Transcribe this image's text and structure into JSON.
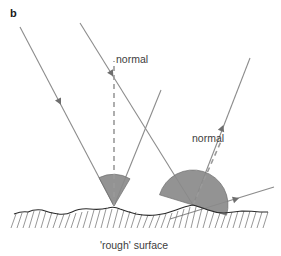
{
  "figure": {
    "panel_letter": "b",
    "caption": "'rough' surface",
    "labels": {
      "normal_left": "normal",
      "normal_right": "normal"
    },
    "colors": {
      "ray_line": "#8c8c8c",
      "arrowhead": "#6e6e6e",
      "normal_dash": "#9a9a9a",
      "wedge_fill": "#8a8a8a",
      "wedge_stroke": "#6f6f6f",
      "surface_line": "#2b2b2b",
      "hatch_line": "#6a6a6a",
      "text": "#3d3d3d",
      "panel_letter": "#1a1a1a",
      "background": "#ffffff"
    },
    "geometry": {
      "incident_rays": [
        {
          "name": "incident-ray-left",
          "x1": 20,
          "y1": 27,
          "x2": 114,
          "y2": 206
        },
        {
          "name": "incident-ray-right",
          "x1": 80,
          "y1": 23,
          "x2": 193,
          "y2": 205
        }
      ],
      "reflected_rays": [
        {
          "name": "reflected-ray-left",
          "x1": 114,
          "y1": 206,
          "x2": 160,
          "y2": 92
        },
        {
          "name": "reflected-ray-right",
          "x1": 193,
          "y1": 205,
          "x2": 249,
          "y2": 60
        }
      ],
      "normals": [
        {
          "name": "normal-left",
          "x1": 114,
          "y1": 206,
          "x2": 114,
          "y2": 60,
          "style": "dashed",
          "orientation": "vertical"
        },
        {
          "name": "normal-right",
          "x1": 193,
          "y1": 205,
          "x2": 222,
          "y2": 140,
          "style": "dashed",
          "orientation": "tilted"
        }
      ],
      "tangent": {
        "name": "surface-tangent-right",
        "x1": 168,
        "y1": 219,
        "x2": 273,
        "y2": 187
      },
      "wedges": [
        {
          "name": "angle-wedge-left",
          "apex_x": 114,
          "apex_y": 206,
          "radius": 32,
          "start_deg": 118,
          "end_deg": 62
        },
        {
          "name": "angle-wedge-right",
          "apex_x": 193,
          "apex_y": 205,
          "radius": 35,
          "start_deg": 163,
          "end_deg": 17
        }
      ],
      "surface": {
        "name": "rough-surface",
        "baseline_y": 212,
        "left_x": 14,
        "right_x": 268,
        "amplitude": 5,
        "hatch_count": 42,
        "hatch_depth": 14
      }
    },
    "label_positions": {
      "panel_letter": {
        "x": 10,
        "y": 16
      },
      "normal_left": {
        "x": 117,
        "y": 62
      },
      "normal_right": {
        "x": 194,
        "y": 141
      },
      "caption": {
        "x": 133,
        "y": 248
      }
    }
  }
}
